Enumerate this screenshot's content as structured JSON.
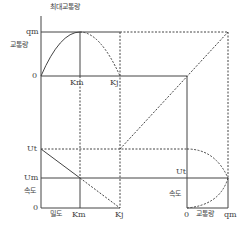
{
  "diagram": {
    "title_top": "최대교통량",
    "top_left": {
      "y_labels": {
        "qm": "qm",
        "flow": "교통량",
        "zero": "0"
      },
      "x_labels": {
        "km": "Km",
        "kj": "Kj"
      }
    },
    "bottom_left": {
      "y_labels": {
        "ut": "Ut",
        "um": "Um",
        "speed": "속도",
        "zero": "0"
      },
      "x_labels": {
        "density": "밀도",
        "km": "Km",
        "kj": "Kj"
      }
    },
    "bottom_right": {
      "y_labels": {
        "ut": "Ut",
        "speed": "속도"
      },
      "x_labels": {
        "zero": "0",
        "flow": "교통량",
        "qm": "qm"
      }
    },
    "colors": {
      "line": "#444444",
      "dashed": "#666666"
    }
  }
}
